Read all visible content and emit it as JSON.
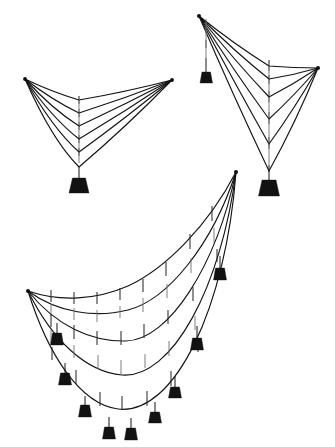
{
  "page": {
    "background_color": "#ffffff",
    "line_color": "#141414",
    "weight_color": "#121212",
    "hanger_color": "#6f6f6f",
    "width": 335,
    "height": 447
  },
  "figures": [
    {
      "id": "figure-top-left",
      "name": "symmetric-funicular-single-load",
      "label": "Symmetric funicular with single central load",
      "anchors": [
        {
          "name": "left-anchor",
          "x": 25,
          "y": 79
        },
        {
          "name": "right-anchor",
          "x": 172,
          "y": 80
        }
      ],
      "cable_count": 6,
      "load_points": 1,
      "weights": [
        {
          "name": "central-weight",
          "x": 79,
          "y": 178,
          "width": 20,
          "height": 15
        }
      ],
      "cables": [
        {
          "name": "cable-1",
          "apex_x": 79,
          "apex_y": 100
        },
        {
          "name": "cable-2",
          "apex_x": 79,
          "apex_y": 113
        },
        {
          "name": "cable-3",
          "apex_x": 79,
          "apex_y": 126
        },
        {
          "name": "cable-4",
          "apex_x": 79,
          "apex_y": 139
        },
        {
          "name": "cable-5",
          "apex_x": 79,
          "apex_y": 152
        },
        {
          "name": "cable-6",
          "apex_x": 79,
          "apex_y": 167
        }
      ]
    },
    {
      "id": "figure-top-right",
      "name": "asymmetric-funicular-two-loads",
      "label": "Asymmetric funicular with two unequal loads",
      "anchors": [
        {
          "name": "left-anchor",
          "x": 199,
          "y": 16
        },
        {
          "name": "right-anchor",
          "x": 318,
          "y": 68
        }
      ],
      "cable_count": 6,
      "load_points": 2,
      "weights": [
        {
          "name": "left-small-weight",
          "x": 207,
          "y": 72,
          "width": 13,
          "height": 11
        },
        {
          "name": "main-weight",
          "x": 269,
          "y": 180,
          "width": 21,
          "height": 16
        }
      ],
      "cables": [
        {
          "name": "cable-1",
          "apex_x": 269,
          "apex_y": 66
        },
        {
          "name": "cable-2",
          "apex_x": 269,
          "apex_y": 79
        },
        {
          "name": "cable-3",
          "apex_x": 269,
          "apex_y": 97
        },
        {
          "name": "cable-4",
          "apex_x": 269,
          "apex_y": 119
        },
        {
          "name": "cable-5",
          "apex_x": 269,
          "apex_y": 144
        },
        {
          "name": "cable-6",
          "apex_x": 269,
          "apex_y": 171
        }
      ]
    },
    {
      "id": "figure-bottom",
      "name": "distributed-load-catenary-net",
      "label": "Catenary net under distributed hanging loads",
      "anchors": [
        {
          "name": "left-anchor",
          "x": 28,
          "y": 291
        },
        {
          "name": "right-anchor",
          "x": 236,
          "y": 172
        }
      ],
      "cable_count": 5,
      "load_points": 9,
      "weights": [
        {
          "name": "weight-r1",
          "x": 214,
          "y": 268,
          "width": 13,
          "height": 11
        },
        {
          "name": "weight-r2",
          "x": 191,
          "y": 338,
          "width": 13,
          "height": 11
        },
        {
          "name": "weight-r3",
          "x": 169,
          "y": 387,
          "width": 12,
          "height": 10
        },
        {
          "name": "weight-r4",
          "x": 149,
          "y": 412,
          "width": 12,
          "height": 10
        },
        {
          "name": "weight-c1",
          "x": 125,
          "y": 428,
          "width": 12,
          "height": 11
        },
        {
          "name": "weight-c2",
          "x": 103,
          "y": 427,
          "width": 12,
          "height": 11
        },
        {
          "name": "weight-l1",
          "x": 79,
          "y": 405,
          "width": 12,
          "height": 11
        },
        {
          "name": "weight-l2",
          "x": 59,
          "y": 373,
          "width": 12,
          "height": 11
        },
        {
          "name": "weight-l3",
          "x": 51,
          "y": 333,
          "width": 12,
          "height": 11
        }
      ]
    }
  ]
}
